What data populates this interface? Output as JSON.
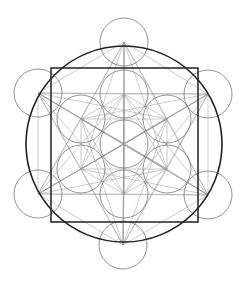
{
  "diagram": {
    "center": [
      124,
      144
    ],
    "outer_circle_radius": 98,
    "small_circle_radius": 24,
    "square": {
      "x": 51,
      "y": 68,
      "w": 147,
      "h": 154
    },
    "outer_vertices": [
      [
        124,
        42
      ],
      [
        208,
        94
      ],
      [
        208,
        195
      ],
      [
        123,
        245
      ],
      [
        38,
        194
      ],
      [
        38,
        93
      ]
    ],
    "inner_vertices": [
      [
        124,
        94
      ],
      [
        167,
        119
      ],
      [
        167,
        169
      ],
      [
        124,
        194
      ],
      [
        81,
        169
      ],
      [
        81,
        119
      ]
    ],
    "colors": {
      "thick": "#222222",
      "thin": "#777777",
      "lines": "#999999"
    }
  }
}
